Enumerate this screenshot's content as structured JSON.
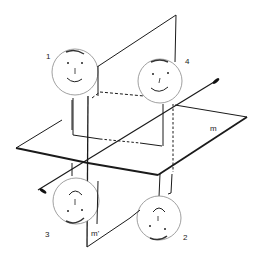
{
  "figure": {
    "labels": {
      "face1": "1",
      "face2": "2",
      "face3": "3",
      "face4": "4",
      "plane_m": "m",
      "plane_m_prime": "m'"
    },
    "faces": [
      {
        "id": "1",
        "expression": "smile",
        "orientation": "upright"
      },
      {
        "id": "4",
        "expression": "smile",
        "orientation": "upright"
      },
      {
        "id": "3",
        "expression": "frown",
        "orientation": "inverted"
      },
      {
        "id": "2",
        "expression": "frown",
        "orientation": "inverted"
      }
    ],
    "colors": {
      "line": "#1a1a1a",
      "face_outline": "#777777",
      "background": "#ffffff"
    }
  }
}
